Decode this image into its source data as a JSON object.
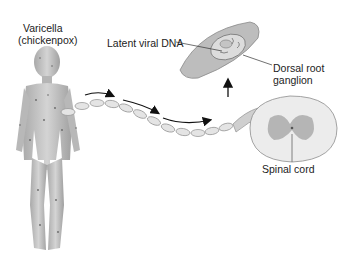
{
  "diagram": {
    "labels": {
      "varicella": "Varicella",
      "chickenpox": "(chickenpox)",
      "latent_dna": "Latent viral DNA",
      "dorsal_root_1": "Dorsal root",
      "dorsal_root_2": "ganglion",
      "spinal_cord": "Spinal cord"
    },
    "elements": [
      {
        "id": "child-figure",
        "kind": "illustration",
        "description": "child with chickenpox spots"
      },
      {
        "id": "sensory-nerve",
        "kind": "illustration",
        "description": "myelinated nerve fiber from skin to spinal cord"
      },
      {
        "id": "travel-arrows",
        "kind": "arrow",
        "count": 3,
        "direction": "toward spinal cord"
      },
      {
        "id": "up-arrow",
        "kind": "arrow",
        "direction": "up to ganglion inset"
      },
      {
        "id": "ganglion-inset",
        "kind": "illustration",
        "description": "enlarged dorsal root ganglion with latent viral DNA"
      },
      {
        "id": "spinal-cord",
        "kind": "illustration",
        "description": "cross-section of spinal cord"
      }
    ]
  }
}
